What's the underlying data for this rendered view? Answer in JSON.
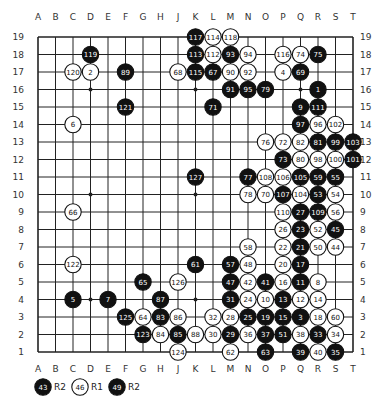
{
  "board": {
    "size": 19,
    "columns": [
      "A",
      "B",
      "C",
      "D",
      "E",
      "F",
      "G",
      "H",
      "J",
      "K",
      "L",
      "M",
      "N",
      "O",
      "P",
      "Q",
      "R",
      "S",
      "T"
    ],
    "rows": [
      19,
      18,
      17,
      16,
      15,
      14,
      13,
      12,
      11,
      10,
      9,
      8,
      7,
      6,
      5,
      4,
      3,
      2,
      1
    ],
    "star_points": [
      "D16",
      "K16",
      "Q16",
      "D10",
      "K10",
      "Q10",
      "D4",
      "K4",
      "Q4"
    ],
    "colors": {
      "black": "#111111",
      "white": "#ffffff",
      "line": "#222222",
      "background": "#ffffff"
    }
  },
  "stones": [
    {
      "n": 1,
      "c": "B",
      "p": "R16"
    },
    {
      "n": 2,
      "c": "W",
      "p": "D17"
    },
    {
      "n": 3,
      "c": "B",
      "p": "Q3"
    },
    {
      "n": 4,
      "c": "W",
      "p": "P17"
    },
    {
      "n": 5,
      "c": "B",
      "p": "C4"
    },
    {
      "n": 6,
      "c": "W",
      "p": "C14"
    },
    {
      "n": 7,
      "c": "B",
      "p": "E4"
    },
    {
      "n": 8,
      "c": "W",
      "p": "R5"
    },
    {
      "n": 9,
      "c": "B",
      "p": "Q15"
    },
    {
      "n": 10,
      "c": "W",
      "p": "O4"
    },
    {
      "n": 11,
      "c": "B",
      "p": "Q5"
    },
    {
      "n": 12,
      "c": "W",
      "p": "Q4"
    },
    {
      "n": 13,
      "c": "B",
      "p": "P4"
    },
    {
      "n": 14,
      "c": "W",
      "p": "R4"
    },
    {
      "n": 15,
      "c": "B",
      "p": "P3"
    },
    {
      "n": 16,
      "c": "W",
      "p": "P5"
    },
    {
      "n": 17,
      "c": "B",
      "p": "Q6"
    },
    {
      "n": 18,
      "c": "W",
      "p": "R3"
    },
    {
      "n": 19,
      "c": "B",
      "p": "O3"
    },
    {
      "n": 20,
      "c": "W",
      "p": "P6"
    },
    {
      "n": 21,
      "c": "B",
      "p": "Q7"
    },
    {
      "n": 22,
      "c": "W",
      "p": "P7"
    },
    {
      "n": 23,
      "c": "B",
      "p": "Q8"
    },
    {
      "n": 24,
      "c": "W",
      "p": "N4"
    },
    {
      "n": 25,
      "c": "B",
      "p": "N3"
    },
    {
      "n": 26,
      "c": "W",
      "p": "P8"
    },
    {
      "n": 27,
      "c": "B",
      "p": "Q9"
    },
    {
      "n": 28,
      "c": "W",
      "p": "M3"
    },
    {
      "n": 29,
      "c": "B",
      "p": "M2"
    },
    {
      "n": 30,
      "c": "W",
      "p": "L2"
    },
    {
      "n": 31,
      "c": "B",
      "p": "M4"
    },
    {
      "n": 32,
      "c": "W",
      "p": "L3"
    },
    {
      "n": 33,
      "c": "B",
      "p": "R2"
    },
    {
      "n": 34,
      "c": "W",
      "p": "S2"
    },
    {
      "n": 35,
      "c": "B",
      "p": "S1"
    },
    {
      "n": 36,
      "c": "W",
      "p": "N2"
    },
    {
      "n": 37,
      "c": "B",
      "p": "O2"
    },
    {
      "n": 38,
      "c": "W",
      "p": "Q2"
    },
    {
      "n": 39,
      "c": "B",
      "p": "Q1"
    },
    {
      "n": 40,
      "c": "W",
      "p": "R1"
    },
    {
      "n": 41,
      "c": "B",
      "p": "O5"
    },
    {
      "n": 42,
      "c": "W",
      "p": "N5"
    },
    {
      "n": 44,
      "c": "W",
      "p": "S7"
    },
    {
      "n": 45,
      "c": "B",
      "p": "S8"
    },
    {
      "n": 47,
      "c": "B",
      "p": "M5"
    },
    {
      "n": 48,
      "c": "W",
      "p": "N6"
    },
    {
      "n": 50,
      "c": "W",
      "p": "R7"
    },
    {
      "n": 51,
      "c": "B",
      "p": "P2"
    },
    {
      "n": 52,
      "c": "W",
      "p": "R8"
    },
    {
      "n": 53,
      "c": "B",
      "p": "R10"
    },
    {
      "n": 54,
      "c": "W",
      "p": "S10"
    },
    {
      "n": 55,
      "c": "B",
      "p": "S11"
    },
    {
      "n": 56,
      "c": "W",
      "p": "S9"
    },
    {
      "n": 57,
      "c": "B",
      "p": "M6"
    },
    {
      "n": 58,
      "c": "W",
      "p": "N7"
    },
    {
      "n": 59,
      "c": "B",
      "p": "R11"
    },
    {
      "n": 60,
      "c": "W",
      "p": "S3"
    },
    {
      "n": 61,
      "c": "B",
      "p": "K6"
    },
    {
      "n": 62,
      "c": "W",
      "p": "M1"
    },
    {
      "n": 63,
      "c": "B",
      "p": "O1"
    },
    {
      "n": 64,
      "c": "W",
      "p": "G3"
    },
    {
      "n": 65,
      "c": "B",
      "p": "G5"
    },
    {
      "n": 66,
      "c": "W",
      "p": "C9"
    },
    {
      "n": 67,
      "c": "B",
      "p": "L17"
    },
    {
      "n": 68,
      "c": "W",
      "p": "J17"
    },
    {
      "n": 69,
      "c": "B",
      "p": "Q17"
    },
    {
      "n": 70,
      "c": "W",
      "p": "O10"
    },
    {
      "n": 71,
      "c": "B",
      "p": "L15"
    },
    {
      "n": 72,
      "c": "W",
      "p": "P13"
    },
    {
      "n": 73,
      "c": "B",
      "p": "P12"
    },
    {
      "n": 74,
      "c": "W",
      "p": "Q18"
    },
    {
      "n": 75,
      "c": "B",
      "p": "R18"
    },
    {
      "n": 76,
      "c": "W",
      "p": "O13"
    },
    {
      "n": 77,
      "c": "B",
      "p": "N11"
    },
    {
      "n": 78,
      "c": "W",
      "p": "N10"
    },
    {
      "n": 79,
      "c": "B",
      "p": "O16"
    },
    {
      "n": 80,
      "c": "W",
      "p": "Q12"
    },
    {
      "n": 81,
      "c": "B",
      "p": "R13"
    },
    {
      "n": 82,
      "c": "W",
      "p": "Q13"
    },
    {
      "n": 83,
      "c": "B",
      "p": "H3"
    },
    {
      "n": 84,
      "c": "W",
      "p": "H2"
    },
    {
      "n": 85,
      "c": "B",
      "p": "J2"
    },
    {
      "n": 86,
      "c": "W",
      "p": "J3"
    },
    {
      "n": 87,
      "c": "B",
      "p": "H4"
    },
    {
      "n": 88,
      "c": "W",
      "p": "K2"
    },
    {
      "n": 89,
      "c": "B",
      "p": "F17"
    },
    {
      "n": 90,
      "c": "W",
      "p": "M17"
    },
    {
      "n": 91,
      "c": "B",
      "p": "M16"
    },
    {
      "n": 92,
      "c": "W",
      "p": "N17"
    },
    {
      "n": 93,
      "c": "B",
      "p": "M18"
    },
    {
      "n": 94,
      "c": "W",
      "p": "N18"
    },
    {
      "n": 95,
      "c": "B",
      "p": "N16"
    },
    {
      "n": 96,
      "c": "W",
      "p": "R14"
    },
    {
      "n": 97,
      "c": "B",
      "p": "Q14"
    },
    {
      "n": 98,
      "c": "W",
      "p": "R12"
    },
    {
      "n": 99,
      "c": "B",
      "p": "S13"
    },
    {
      "n": 100,
      "c": "W",
      "p": "S12"
    },
    {
      "n": 101,
      "c": "B",
      "p": "T12"
    },
    {
      "n": 102,
      "c": "W",
      "p": "S14"
    },
    {
      "n": 103,
      "c": "B",
      "p": "T13"
    },
    {
      "n": 104,
      "c": "W",
      "p": "Q10"
    },
    {
      "n": 105,
      "c": "B",
      "p": "Q11"
    },
    {
      "n": 106,
      "c": "W",
      "p": "P11"
    },
    {
      "n": 107,
      "c": "B",
      "p": "P10"
    },
    {
      "n": 108,
      "c": "W",
      "p": "O11"
    },
    {
      "n": 109,
      "c": "B",
      "p": "R9"
    },
    {
      "n": 110,
      "c": "W",
      "p": "P9"
    },
    {
      "n": 111,
      "c": "B",
      "p": "R15"
    },
    {
      "n": 112,
      "c": "W",
      "p": "L18"
    },
    {
      "n": 113,
      "c": "B",
      "p": "K18"
    },
    {
      "n": 114,
      "c": "W",
      "p": "L19"
    },
    {
      "n": 115,
      "c": "B",
      "p": "K17"
    },
    {
      "n": 116,
      "c": "W",
      "p": "P18"
    },
    {
      "n": 117,
      "c": "B",
      "p": "K19"
    },
    {
      "n": 118,
      "c": "W",
      "p": "M19"
    },
    {
      "n": 119,
      "c": "B",
      "p": "D18"
    },
    {
      "n": 120,
      "c": "W",
      "p": "C17"
    },
    {
      "n": 121,
      "c": "B",
      "p": "F15"
    },
    {
      "n": 122,
      "c": "W",
      "p": "C6"
    },
    {
      "n": 123,
      "c": "B",
      "p": "G2"
    },
    {
      "n": 124,
      "c": "W",
      "p": "J1"
    },
    {
      "n": 125,
      "c": "B",
      "p": "F3"
    },
    {
      "n": 126,
      "c": "W",
      "p": "J5"
    },
    {
      "n": 127,
      "c": "B",
      "p": "K11"
    }
  ],
  "legend": [
    {
      "n": 43,
      "c": "B",
      "label": "R2"
    },
    {
      "n": 46,
      "c": "W",
      "label": "R1"
    },
    {
      "n": 49,
      "c": "B",
      "label": "R2"
    }
  ]
}
